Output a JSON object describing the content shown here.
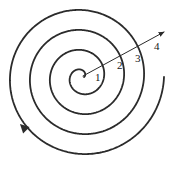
{
  "figure": {
    "name": "archimedean-spiral-diagram",
    "background_color": "#ffffff",
    "stroke_color": "#2b2b2b",
    "label_color": "#151515",
    "width": 194,
    "height": 182
  },
  "spiral": {
    "center": {
      "x": 82,
      "y": 77
    },
    "turns": 4,
    "direction": "counterclockwise",
    "start_radius": 2,
    "radius_per_turn": 20,
    "outer_end_arrowhead": {
      "x": 20,
      "y": 124,
      "angle_deg": 225
    },
    "stroke_width": 1.8
  },
  "radial_arrow": {
    "name": "radius-vector",
    "from": {
      "x": 83,
      "y": 76
    },
    "to": {
      "x": 164,
      "y": 32
    },
    "arrowhead_at": "to",
    "stroke_width": 1.0
  },
  "labels": [
    {
      "text": "1",
      "x": 95,
      "y": 72
    },
    {
      "text": "2",
      "x": 117,
      "y": 60
    },
    {
      "text": "3",
      "x": 135,
      "y": 53
    },
    {
      "text": "4",
      "x": 154,
      "y": 41
    }
  ]
}
